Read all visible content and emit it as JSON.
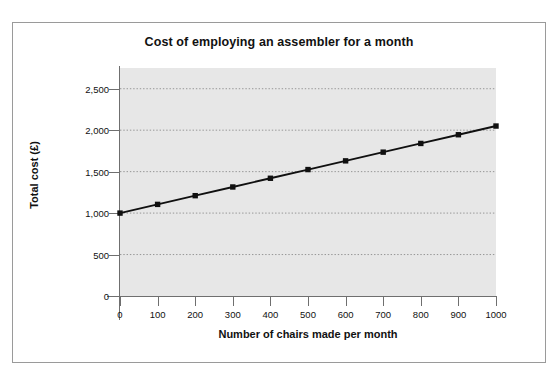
{
  "chart_data": {
    "type": "line",
    "title": "Cost of employing an assembler for a month",
    "xlabel": "Number of chairs made per month",
    "ylabel": "Total cost (£)",
    "x": [
      0,
      100,
      200,
      300,
      400,
      500,
      600,
      700,
      800,
      900,
      1000
    ],
    "values": [
      1000,
      1105,
      1210,
      1315,
      1420,
      1525,
      1630,
      1735,
      1840,
      1945,
      2050
    ],
    "series": [
      {
        "name": "Total cost",
        "values": [
          1000,
          1105,
          1210,
          1315,
          1420,
          1525,
          1630,
          1735,
          1840,
          1945,
          2050
        ]
      }
    ],
    "xlim": [
      0,
      1000
    ],
    "ylim": [
      0,
      2750
    ],
    "xticks": [
      0,
      100,
      200,
      300,
      400,
      500,
      600,
      700,
      800,
      900,
      1000
    ],
    "xtick_labels": [
      "0",
      "100",
      "200",
      "300",
      "400",
      "500",
      "600",
      "700",
      "800",
      "900",
      "1000"
    ],
    "yticks": [
      0,
      500,
      1000,
      1500,
      2000,
      2500
    ],
    "ytick_labels": [
      "0",
      "500",
      "1,000",
      "1,500",
      "2,000",
      "2,500"
    ],
    "grid": "horizontal-dotted",
    "legend": "none",
    "marker": "square",
    "colors": {
      "line": "#101010",
      "marker": "#101010",
      "plot_background": "#e7e7e7",
      "figure_background": "#ffffff",
      "frame_border": "#9a9a9a",
      "axis": "#6f6f6f",
      "gridline": "#8c8c8c",
      "text": "#111111"
    }
  }
}
